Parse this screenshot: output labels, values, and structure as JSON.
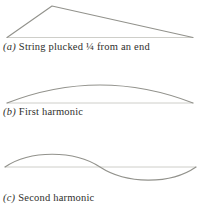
{
  "figure": {
    "panels": [
      {
        "label": "(a)",
        "caption": "String plucked ¼ from an end",
        "shape": "triangular-pluck-peak-at-quarter-length"
      },
      {
        "label": "(b)",
        "caption": "First harmonic",
        "shape": "half-wave-arc"
      },
      {
        "label": "(c)",
        "caption": "Second harmonic",
        "shape": "full-sine-wave"
      }
    ],
    "colors": {
      "string": "#92928c",
      "baseline": "#c8c8c3",
      "text": "#2f2f2d",
      "background": "#ffffff"
    }
  }
}
